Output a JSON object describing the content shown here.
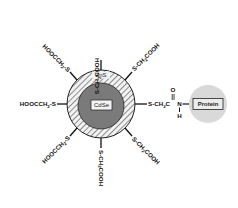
{
  "diagram": {
    "shell_label": "ZnS",
    "core_label": "CdSe",
    "protein_label": "Protein",
    "ligands": {
      "top": {
        "prefix": "S-CH",
        "sub": "2",
        "suffix": "COOH"
      },
      "top_right": {
        "prefix": "S-CH",
        "sub": "2",
        "suffix": "COOH"
      },
      "top_left": {
        "prefix": "HOOCCH",
        "sub": "2",
        "suffix": "-S"
      },
      "left": {
        "prefix": "HOOCCH",
        "sub": "2",
        "suffix": "-S"
      },
      "bottom_left": {
        "prefix": "HOOCCH",
        "sub": "2",
        "suffix": "-S"
      },
      "bottom": {
        "prefix": "S-CH",
        "sub": "2",
        "suffix": "COOH"
      },
      "bottom_right": {
        "prefix": "S-CH",
        "sub": "2",
        "suffix": "COOH"
      }
    },
    "amide_link": {
      "chain_prefix": "S-CH",
      "chain_sub": "2",
      "chain_suffix": "C",
      "carbonyl_o": "O",
      "nitrogen": "N",
      "hydrogen": "H"
    },
    "colors": {
      "core": "#7a7a7a",
      "shell_bg": "#f2f2f2",
      "hatch": "#555555",
      "protein": "#d9d9d9",
      "outline": "#222222"
    }
  }
}
